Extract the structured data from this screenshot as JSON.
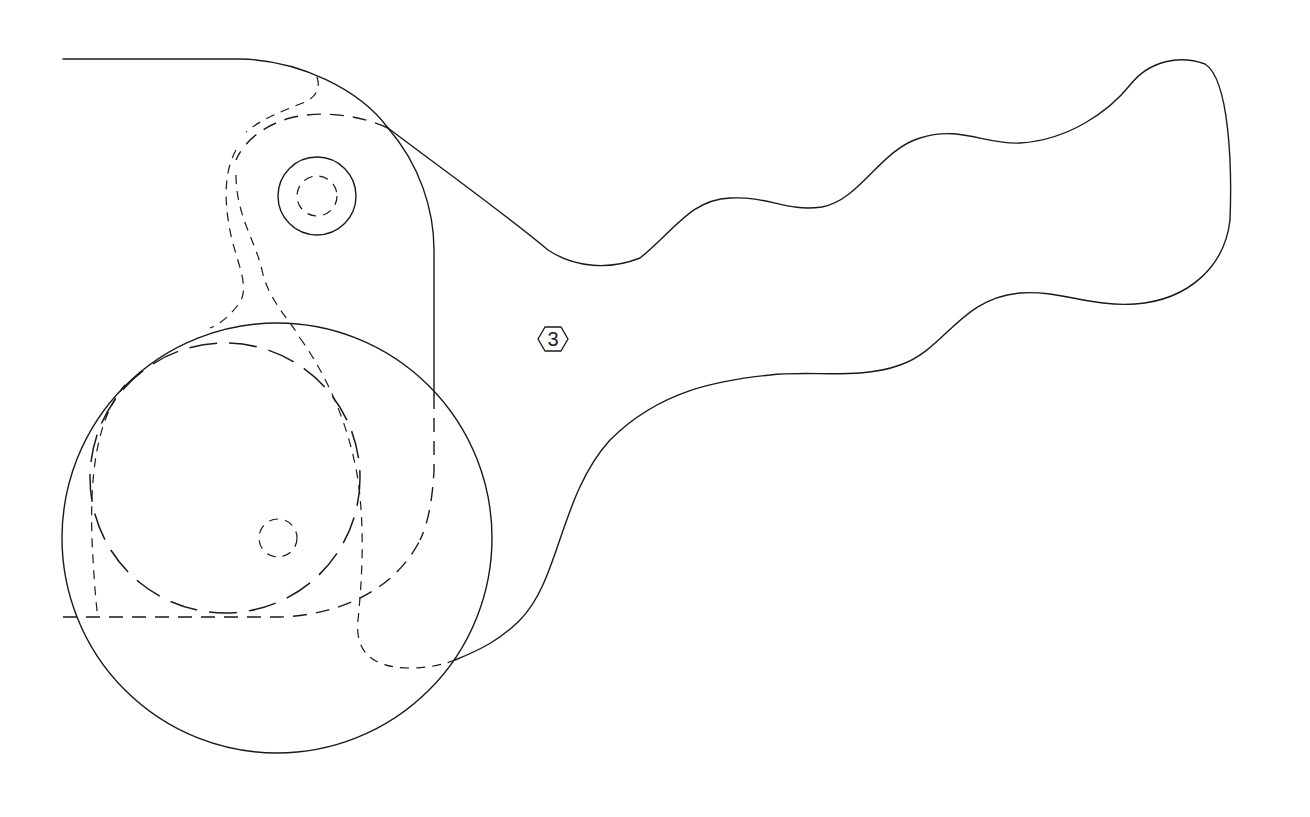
{
  "drawing": {
    "type": "patent-line-drawing",
    "subject": "lever arm with wavy handle and circular hub",
    "stroke_color": "#1a1a1a",
    "background": "#ffffff",
    "reference_labels": [
      {
        "id": "part-3",
        "text": "3",
        "shape": "hexagon",
        "x": 553,
        "y": 339
      }
    ]
  }
}
